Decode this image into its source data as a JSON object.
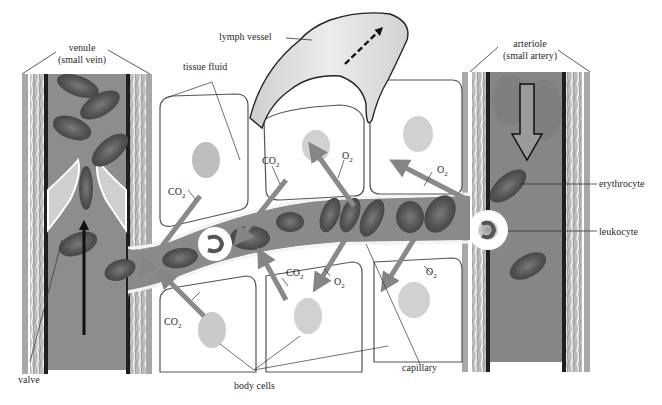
{
  "diagram": {
    "type": "capillary-exchange-illustration",
    "style": "grayscale",
    "colors": {
      "background": "#ffffff",
      "blood": "#7a7a7a",
      "blood_light": "#9a9a9a",
      "rbc": "#5e5e5e",
      "vessel_wall": "#b8b8b8",
      "arrow_gray": "#8a8a8a",
      "line": "#333333"
    }
  },
  "labels": {
    "venule_line1": "venule",
    "venule_line2": "(small vein)",
    "tissue_fluid": "tissue fluid",
    "lymph_vessel": "lymph vessel",
    "arteriole_line1": "arteriole",
    "arteriole_line2": "(small artery)",
    "erythrocyte": "erythrocyte",
    "leukocyte": "leukocyte",
    "capillary": "capillary",
    "body_cells": "body cells",
    "valve": "valve"
  },
  "gas_labels": [
    {
      "id": "co2-1",
      "text": "CO",
      "sub": "2"
    },
    {
      "id": "co2-2",
      "text": "CO",
      "sub": "2"
    },
    {
      "id": "co2-3",
      "text": "CO",
      "sub": "2"
    },
    {
      "id": "co2-4",
      "text": "CO",
      "sub": "2"
    },
    {
      "id": "o2-1",
      "text": "O",
      "sub": "2"
    },
    {
      "id": "o2-2",
      "text": "O",
      "sub": "2"
    },
    {
      "id": "o2-3",
      "text": "O",
      "sub": "2"
    },
    {
      "id": "o2-4",
      "text": "O",
      "sub": "2"
    }
  ]
}
